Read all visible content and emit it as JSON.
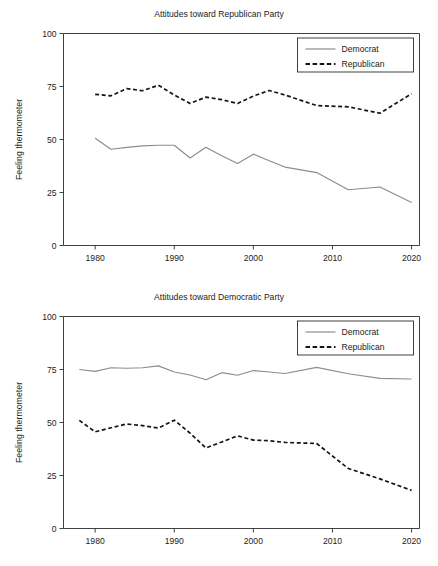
{
  "figure": {
    "background_color": "#ffffff",
    "width": 438,
    "height": 566
  },
  "panels": [
    {
      "id": "republican-party-panel",
      "title": "Attitudes toward Republican Party",
      "ylabel": "Feeling thermometer"
    },
    {
      "id": "democratic-party-panel",
      "title": "Attitudes toward Democratic Party",
      "ylabel": "Feeling thermometer"
    }
  ],
  "legend": {
    "items": [
      {
        "label": "Democrat",
        "color": "#8c8c8c",
        "style": "solid"
      },
      {
        "label": "Republican",
        "color": "#141414",
        "style": "dashed"
      }
    ]
  },
  "chart_data": [
    {
      "type": "line",
      "title": "Attitudes toward Republican Party",
      "xlabel": "",
      "ylabel": "Feeling thermometer",
      "xlim": [
        1976,
        2021
      ],
      "ylim": [
        0,
        100
      ],
      "xticks": [
        1980,
        1990,
        2000,
        2010,
        2020
      ],
      "yticks": [
        0,
        25,
        50,
        75,
        100
      ],
      "grid": false,
      "legend_position": "upper right",
      "series": [
        {
          "name": "Democrat",
          "color": "#8c8c8c",
          "style": "solid",
          "x": [
            1980,
            1982,
            1984,
            1986,
            1988,
            1990,
            1992,
            1994,
            1996,
            1998,
            2000,
            2002,
            2004,
            2008,
            2012,
            2016,
            2020
          ],
          "values": [
            50.6,
            45.4,
            46.3,
            47.0,
            47.3,
            47.3,
            41.3,
            46.3,
            42.3,
            38.7,
            43.1,
            40.0,
            37.0,
            34.4,
            26.3,
            27.6,
            20.3
          ]
        },
        {
          "name": "Republican",
          "color": "#141414",
          "style": "dashed",
          "x": [
            1980,
            1982,
            1984,
            1986,
            1988,
            1990,
            1992,
            1994,
            1996,
            1998,
            2000,
            2002,
            2004,
            2008,
            2012,
            2016,
            2020
          ],
          "values": [
            71.3,
            70.6,
            74.0,
            73.0,
            75.6,
            71.0,
            67.0,
            70.0,
            68.8,
            67.0,
            70.5,
            73.1,
            71.0,
            66.0,
            65.4,
            62.4,
            71.6
          ]
        }
      ]
    },
    {
      "type": "line",
      "title": "Attitudes toward Democratic Party",
      "xlabel": "",
      "ylabel": "Feeling thermometer",
      "xlim": [
        1976,
        2021
      ],
      "ylim": [
        0,
        100
      ],
      "xticks": [
        1980,
        1990,
        2000,
        2010,
        2020
      ],
      "yticks": [
        0,
        25,
        50,
        75,
        100
      ],
      "grid": false,
      "legend_position": "upper right",
      "series": [
        {
          "name": "Democrat",
          "color": "#8c8c8c",
          "style": "solid",
          "x": [
            1978,
            1980,
            1982,
            1984,
            1986,
            1988,
            1990,
            1992,
            1994,
            1996,
            1998,
            2000,
            2002,
            2004,
            2008,
            2012,
            2016,
            2020
          ],
          "values": [
            75.0,
            74.1,
            75.8,
            75.6,
            75.8,
            76.7,
            73.8,
            72.4,
            70.2,
            73.5,
            72.3,
            74.5,
            73.8,
            73.1,
            76.0,
            73.0,
            70.8,
            70.5
          ]
        },
        {
          "name": "Republican",
          "color": "#141414",
          "style": "dashed",
          "x": [
            1978,
            1980,
            1982,
            1984,
            1986,
            1988,
            1990,
            1992,
            1994,
            1996,
            1998,
            2000,
            2002,
            2004,
            2008,
            2012,
            2016,
            2020
          ],
          "values": [
            51.0,
            45.6,
            47.5,
            49.3,
            48.5,
            47.4,
            51.1,
            45.0,
            38.0,
            40.8,
            43.7,
            41.7,
            41.4,
            40.6,
            40.1,
            28.3,
            23.4,
            18.0
          ]
        }
      ]
    }
  ]
}
